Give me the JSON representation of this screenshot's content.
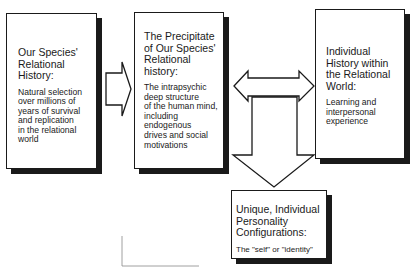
{
  "boxes": {
    "species_history": {
      "title": [
        "Our Species'",
        "Relational",
        "History:"
      ],
      "body": [
        "Natural selection",
        "over millions of",
        "years of survival",
        "and replication",
        "in the relational",
        "world"
      ]
    },
    "precipitate": {
      "title": [
        "The Precipitate",
        "of Our Species'",
        "Relational",
        "history:"
      ],
      "body": [
        "The intrapsychic",
        "deep structure",
        "of the human mind,",
        "including",
        "endogenous",
        "drives and social",
        "motivations"
      ]
    },
    "individual_history": {
      "title": [
        "Individual",
        "History within",
        "the Relational",
        "World:"
      ],
      "body": [
        "Learning and",
        "interpersonal",
        "experience"
      ]
    },
    "personality": {
      "title": [
        "Unique, Individual",
        "Personality",
        "Configurations:"
      ],
      "body": [
        "The \"self\" or \"identity\""
      ]
    }
  },
  "arrows": [
    {
      "name": "species-to-precipitate",
      "type": "right"
    },
    {
      "name": "precipitate-individual",
      "type": "bidirectional"
    },
    {
      "name": "to-personality",
      "type": "down"
    }
  ],
  "colors": {
    "ink": "#1a1a1a",
    "background": "#ffffff"
  }
}
